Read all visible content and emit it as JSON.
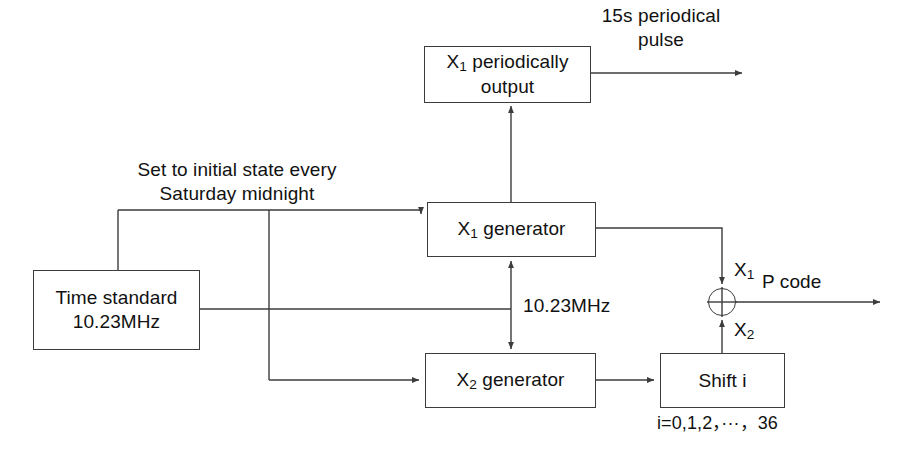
{
  "diagram": {
    "stroke_color": "#3c3c3c",
    "text_color": "#111111",
    "background": "#ffffff",
    "nodes": [
      {
        "id": "x1-periodically-output",
        "name": "x1-periodically-output-box",
        "text": "X1 periodically output",
        "line1_prefix": "X",
        "line1_sub": "1",
        "line1_rest": " periodically",
        "line2": "output",
        "x": 424,
        "y": 46,
        "w": 167,
        "h": 57
      },
      {
        "id": "x1-generator",
        "name": "x1-generator-box",
        "text": "X1 generator",
        "line1_prefix": "X",
        "line1_sub": "1",
        "line1_rest": " generator",
        "line2": "",
        "x": 427,
        "y": 202,
        "w": 169,
        "h": 55
      },
      {
        "id": "time-standard",
        "name": "time-standard-box",
        "text": "Time standard 10.23MHz",
        "line1_prefix": "Time standard",
        "line1_sub": "",
        "line1_rest": "",
        "line2": "10.23MHz",
        "x": 33,
        "y": 270,
        "w": 167,
        "h": 80
      },
      {
        "id": "x2-generator",
        "name": "x2-generator-box",
        "text": "X2 generator",
        "line1_prefix": "X",
        "line1_sub": "2",
        "line1_rest": " generator",
        "line2": "",
        "x": 425,
        "y": 353,
        "w": 171,
        "h": 55
      },
      {
        "id": "shift-i",
        "name": "shift-i-box",
        "text": "Shift i",
        "line1_prefix": "Shift i",
        "line1_sub": "",
        "line1_rest": "",
        "line2": "",
        "x": 660,
        "y": 353,
        "w": 125,
        "h": 55
      }
    ],
    "xor_gate": {
      "name": "xor-summing-junction",
      "cx": 722,
      "cy": 302,
      "r": 14
    },
    "annotations": [
      {
        "id": "pulse-label",
        "name": "periodical-pulse-label",
        "text": "15s periodical\npulse",
        "x": 571,
        "y": 4,
        "w": 180,
        "align": "center"
      },
      {
        "id": "reset-label",
        "name": "weekly-reset-label",
        "text": "Set to initial state every\nSaturday midnight",
        "x": 113,
        "y": 158,
        "w": 248,
        "align": "center"
      },
      {
        "id": "clock-label",
        "name": "clock-rate-label",
        "text": "10.23MHz",
        "x": 523,
        "y": 294,
        "w": 120,
        "align": "left"
      },
      {
        "id": "pcode-label",
        "name": "p-code-output-label",
        "text": "P code",
        "x": 762,
        "y": 270,
        "w": 90,
        "align": "left"
      },
      {
        "id": "shift-range-label",
        "name": "shift-index-range-label",
        "text": "i=0,1,2，···，36",
        "x": 657,
        "y": 412,
        "w": 185,
        "align": "left",
        "small": true
      }
    ],
    "signal_labels": [
      {
        "id": "x1-signal",
        "name": "x1-signal-label",
        "prefix": "X",
        "sub": "1",
        "x": 734,
        "y": 258
      },
      {
        "id": "x2-signal",
        "name": "x2-signal-label",
        "prefix": "X",
        "sub": "2",
        "x": 734,
        "y": 318
      }
    ],
    "wires": [
      {
        "name": "pulse-output-wire",
        "d": "M 591 73 L 742 73",
        "arrow": true
      },
      {
        "name": "x1-gen-to-periodic-output-wire",
        "d": "M 511 202 L 511 106",
        "arrow": true
      },
      {
        "name": "reset-riser-left-wire",
        "d": "M 118 270 L 118 210",
        "arrow": false
      },
      {
        "name": "reset-bus-to-x1-gen-wire",
        "d": "M 118 210 L 421 210 L 421 214",
        "arrow": true
      },
      {
        "name": "reset-branch-down-wire",
        "d": "M 269 210 L 269 380",
        "arrow": false
      },
      {
        "name": "reset-branch-to-x2-gen-wire",
        "d": "M 269 380 L 419 380",
        "arrow": true
      },
      {
        "name": "clock-bus-wire",
        "d": "M 200 309 L 511 309",
        "arrow": false
      },
      {
        "name": "clock-to-x1-gen-wire",
        "d": "M 511 309 L 511 261",
        "arrow": true
      },
      {
        "name": "clock-to-x2-gen-wire",
        "d": "M 511 309 L 511 349",
        "arrow": true
      },
      {
        "name": "x1-gen-to-xor-wire",
        "d": "M 596 228 L 722 228 L 722 284",
        "arrow": true
      },
      {
        "name": "shift-to-xor-wire",
        "d": "M 722 353 L 722 320",
        "arrow": true
      },
      {
        "name": "x2-gen-to-shift-wire",
        "d": "M 596 380 L 654 380",
        "arrow": true
      },
      {
        "name": "p-code-output-wire",
        "d": "M 736 302 L 880 302",
        "arrow": true
      }
    ]
  }
}
